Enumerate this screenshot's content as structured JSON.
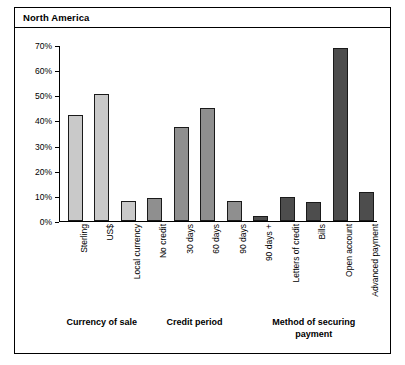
{
  "panel": {
    "title": "North America"
  },
  "chart_data": {
    "type": "bar",
    "title": "North America",
    "xlabel": "",
    "ylabel": "",
    "ylim": [
      0,
      70
    ],
    "grid": false,
    "legend": "none",
    "ytick_labels": [
      "0%",
      "10%",
      "20%",
      "30%",
      "40%",
      "50%",
      "60%",
      "70%"
    ],
    "ytick_values": [
      0,
      10,
      20,
      30,
      40,
      50,
      60,
      70
    ],
    "categories": [
      "Sterling",
      "US$",
      "Local currency",
      "No credit",
      "30 days",
      "60 days",
      "90 days",
      "90 days +",
      "Letters of credit",
      "Bills",
      "Open account",
      "Advanced payment"
    ],
    "values": [
      42,
      50.5,
      8,
      9,
      37.5,
      45,
      8,
      2,
      9.5,
      7.5,
      69,
      11.5
    ],
    "groups": [
      {
        "label": "Currency of sale",
        "start": 0,
        "count": 3,
        "color": "#c9c9c9"
      },
      {
        "label": "Credit period",
        "start": 3,
        "count": 4,
        "color": "#8f8f8f"
      },
      {
        "label": "Method of securing payment",
        "start": 7,
        "count": 5,
        "color": "#4d4d4d"
      }
    ],
    "bar_colors": [
      "#c9c9c9",
      "#c9c9c9",
      "#c9c9c9",
      "#8f8f8f",
      "#8f8f8f",
      "#8f8f8f",
      "#8f8f8f",
      "#4d4d4d",
      "#4d4d4d",
      "#4d4d4d",
      "#4d4d4d",
      "#4d4d4d"
    ],
    "group_captions": [
      "Currency of sale",
      "Credit period",
      "Method of securing payment"
    ]
  }
}
